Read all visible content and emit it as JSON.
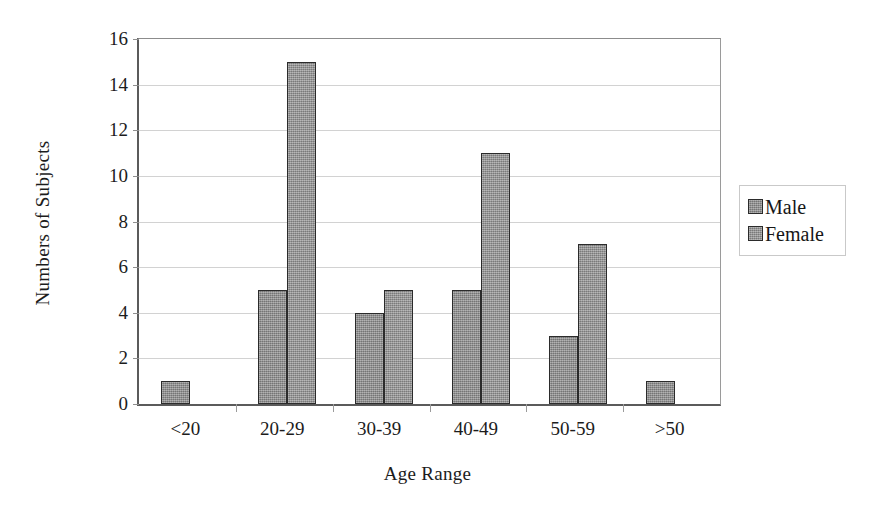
{
  "chart_data": {
    "type": "bar",
    "title": "",
    "subtitle": "",
    "xlabel": "Age Range",
    "ylabel": "Numbers of Subjects",
    "categories": [
      "<20",
      "20-29",
      "30-39",
      "40-49",
      "50-59",
      ">50"
    ],
    "series": [
      {
        "name": "Male",
        "values": [
          1,
          5,
          4,
          5,
          3,
          1
        ],
        "color": "#8d8d8d"
      },
      {
        "name": "Female",
        "values": [
          0,
          15,
          5,
          11,
          7,
          0
        ],
        "color": "#949494"
      }
    ],
    "ylim": [
      0,
      16
    ],
    "ytick_step": 2,
    "yticks": [
      0,
      2,
      4,
      6,
      8,
      10,
      12,
      14,
      16
    ],
    "ytick_labels": [
      "0",
      "2",
      "4",
      "6",
      "8",
      "10",
      "12",
      "14",
      "16"
    ],
    "grid": true,
    "grid_axis": "y",
    "grid_color": "#d2d2d2",
    "legend": true,
    "legend_position": "right",
    "legend_entries": [
      "Male",
      "Female"
    ],
    "bar_border_color": "#2b2b2b",
    "axis_color": "#5b5b5b",
    "background": "#ffffff"
  }
}
